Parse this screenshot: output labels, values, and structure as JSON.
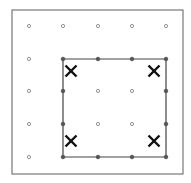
{
  "diagram": {
    "type": "geoboard",
    "frame": {
      "x": 12,
      "y": 10,
      "width": 171,
      "height": 164,
      "stroke": "#777777"
    },
    "grid": {
      "cols": 5,
      "rows": 5,
      "xs": [
        29,
        63,
        98,
        132,
        166
      ],
      "ys": [
        26,
        59,
        91,
        124,
        157
      ],
      "dot_color": "#888888"
    },
    "square": {
      "from": [
        1,
        1
      ],
      "to": [
        4,
        4
      ],
      "stroke": "#444444"
    },
    "marks": [
      {
        "label": "X",
        "col": 1,
        "row": 1,
        "x": 71,
        "y": 71
      },
      {
        "label": "X",
        "col": 4,
        "row": 1,
        "x": 154,
        "y": 71
      },
      {
        "label": "X",
        "col": 1,
        "row": 4,
        "x": 71,
        "y": 141
      },
      {
        "label": "X",
        "col": 4,
        "row": 4,
        "x": 154,
        "y": 141
      }
    ]
  }
}
